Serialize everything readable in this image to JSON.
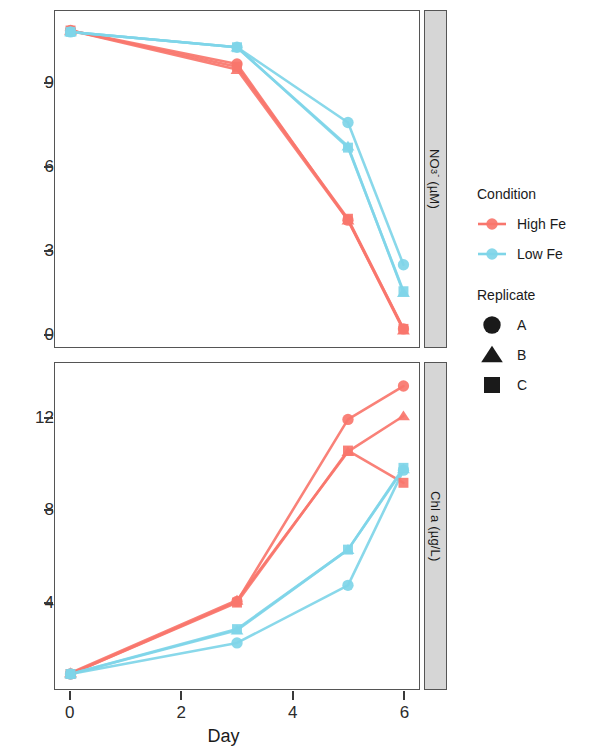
{
  "chart_data": {
    "type": "line",
    "title": "",
    "xlabel": "Day",
    "ylabel": "",
    "grid": false,
    "legend_position": "right",
    "x_ticks": [
      0,
      2,
      4,
      6
    ],
    "x_tick_labels": [
      "0",
      "2",
      "4",
      "6"
    ],
    "xlim": [
      -0.28,
      6.28
    ],
    "panels": [
      {
        "strip_label": "NO3- (uM)",
        "strip_label_main": "NO",
        "strip_label_sub": "3",
        "strip_label_sup": "-",
        "strip_label_unit": " (µM)",
        "ylim": [
          -0.45,
          11.6
        ],
        "y_ticks": [
          0,
          3,
          6,
          9
        ],
        "y_tick_labels": [
          "0",
          "3",
          "6",
          "9"
        ],
        "series": [
          {
            "name": "High Fe A",
            "condition": "High Fe",
            "replicate": "A",
            "marker": "circle",
            "x": [
              0,
              3,
              5,
              6
            ],
            "y": [
              10.9,
              9.7,
              4.1,
              0.2
            ]
          },
          {
            "name": "High Fe B",
            "condition": "High Fe",
            "replicate": "B",
            "marker": "triangle",
            "x": [
              0,
              3,
              5,
              6
            ],
            "y": [
              10.9,
              9.5,
              4.1,
              0.15
            ]
          },
          {
            "name": "High Fe C",
            "condition": "High Fe",
            "replicate": "C",
            "marker": "square",
            "x": [
              0,
              3,
              5,
              6
            ],
            "y": [
              10.9,
              9.6,
              4.15,
              0.2
            ]
          },
          {
            "name": "Low Fe A",
            "condition": "Low Fe",
            "replicate": "A",
            "marker": "circle",
            "x": [
              0,
              3,
              5,
              6
            ],
            "y": [
              10.85,
              10.3,
              7.6,
              2.5
            ]
          },
          {
            "name": "Low Fe B",
            "condition": "Low Fe",
            "replicate": "B",
            "marker": "triangle",
            "x": [
              0,
              3,
              5,
              6
            ],
            "y": [
              10.85,
              10.3,
              6.75,
              1.5
            ]
          },
          {
            "name": "Low Fe C",
            "condition": "Low Fe",
            "replicate": "C",
            "marker": "square",
            "x": [
              0,
              3,
              5,
              6
            ],
            "y": [
              10.85,
              10.3,
              6.7,
              1.55
            ]
          }
        ]
      },
      {
        "strip_label": "Chl a (ug/L)",
        "strip_label_main": "Chl a (µg/L)",
        "ylim": [
          0.25,
          14.4
        ],
        "y_ticks": [
          4,
          8,
          12
        ],
        "y_tick_labels": [
          "4",
          "8",
          "12"
        ],
        "series": [
          {
            "name": "High Fe A",
            "condition": "High Fe",
            "replicate": "A",
            "marker": "circle",
            "x": [
              0,
              3,
              5,
              6
            ],
            "y": [
              0.9,
              4.05,
              11.95,
              13.4
            ]
          },
          {
            "name": "High Fe B",
            "condition": "High Fe",
            "replicate": "B",
            "marker": "triangle",
            "x": [
              0,
              3,
              5,
              6
            ],
            "y": [
              0.95,
              4.1,
              10.55,
              12.1
            ]
          },
          {
            "name": "High Fe C",
            "condition": "High Fe",
            "replicate": "C",
            "marker": "square",
            "x": [
              0,
              3,
              5,
              6
            ],
            "y": [
              0.9,
              4.0,
              10.6,
              9.2
            ]
          },
          {
            "name": "Low Fe A",
            "condition": "Low Fe",
            "replicate": "A",
            "marker": "circle",
            "x": [
              0,
              3,
              5,
              6
            ],
            "y": [
              0.9,
              2.25,
              4.75,
              9.75
            ]
          },
          {
            "name": "Low Fe B",
            "condition": "Low Fe",
            "replicate": "B",
            "marker": "triangle",
            "x": [
              0,
              3,
              5,
              6
            ],
            "y": [
              0.9,
              2.8,
              6.3,
              9.8
            ]
          },
          {
            "name": "Low Fe C",
            "condition": "Low Fe",
            "replicate": "C",
            "marker": "square",
            "x": [
              0,
              3,
              5,
              6
            ],
            "y": [
              0.9,
              2.85,
              6.3,
              9.85
            ]
          }
        ]
      }
    ],
    "colors": {
      "High Fe": "#F8766D",
      "Low Fe": "#7FD5E8"
    }
  },
  "legend": {
    "condition": {
      "title": "Condition",
      "items": [
        {
          "label": "High Fe",
          "color": "#F8766D"
        },
        {
          "label": "Low Fe",
          "color": "#7FD5E8"
        }
      ]
    },
    "replicate": {
      "title": "Replicate",
      "items": [
        {
          "label": "A",
          "marker": "circle"
        },
        {
          "label": "B",
          "marker": "triangle"
        },
        {
          "label": "C",
          "marker": "square"
        }
      ]
    }
  },
  "axes": {
    "x_title": "Day"
  }
}
